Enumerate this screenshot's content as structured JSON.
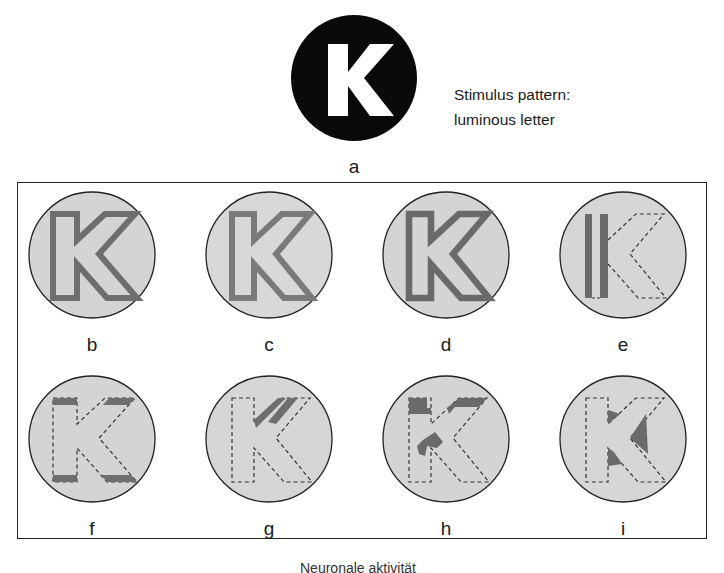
{
  "stimulus": {
    "label": "a",
    "letter": "K",
    "caption_line1": "Stimulus pattern:",
    "caption_line2": "luminous letter"
  },
  "panels": [
    {
      "label": "b"
    },
    {
      "label": "c"
    },
    {
      "label": "d"
    },
    {
      "label": "e"
    },
    {
      "label": "f"
    },
    {
      "label": "g"
    },
    {
      "label": "h"
    },
    {
      "label": "i"
    }
  ],
  "footer_text": "Neuronale aktivität",
  "colors": {
    "disc_fill": "#d4d4d4",
    "active_stroke": "#707070",
    "outline": "#222222",
    "stimulus_bg": "#0a0a0a",
    "letter": "#ffffff"
  }
}
